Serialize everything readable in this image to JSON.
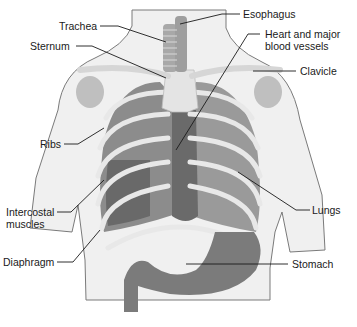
{
  "diagram": {
    "type": "anatomical-illustration",
    "colors": {
      "background": "#ffffff",
      "body_fill": "#f0f0f0",
      "body_outline": "#7a7a7a",
      "bone": "#e6e6e6",
      "lung": "#8c8c8c",
      "lung_dark": "#5a5a5a",
      "heart": "#6a6a6a",
      "stomach": "#7b7b7b",
      "leader_line": "#1a1a1a",
      "label_text": "#1a1a1a"
    },
    "labels": {
      "trachea": "Trachea",
      "sternum": "Sternum",
      "esophagus": "Esophagus",
      "heart_line1": "Heart and major",
      "heart_line2": "blood vessels",
      "clavicle": "Clavicle",
      "ribs": "Ribs",
      "intercostal_line1": "Intercostal",
      "intercostal_line2": "muscles",
      "lungs": "Lungs",
      "diaphragm": "Diaphragm",
      "stomach": "Stomach"
    }
  }
}
